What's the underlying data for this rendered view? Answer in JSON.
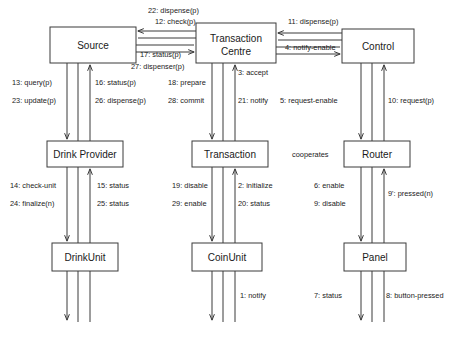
{
  "diagram": {
    "stroke_color": "#3a3a3a",
    "text_color": "#1a1a1a",
    "background": "#ffffff",
    "caption": "",
    "nodes": [
      {
        "id": "source",
        "label": "Source",
        "x": 50,
        "y": 27,
        "w": 86,
        "h": 36
      },
      {
        "id": "transaction-centre",
        "label": "Transaction",
        "label2": "Centre",
        "x": 196,
        "y": 23,
        "w": 80,
        "h": 40
      },
      {
        "id": "control",
        "label": "Control",
        "x": 342,
        "y": 29,
        "w": 72,
        "h": 34
      },
      {
        "id": "drink-provider",
        "label": "Drink Provider",
        "x": 47,
        "y": 141,
        "w": 76,
        "h": 26
      },
      {
        "id": "transaction",
        "label": "Transaction",
        "x": 192,
        "y": 141,
        "w": 76,
        "h": 26
      },
      {
        "id": "router",
        "label": "Router",
        "x": 344,
        "y": 141,
        "w": 66,
        "h": 26
      },
      {
        "id": "drinkunit",
        "label": "DrinkUnit",
        "x": 52,
        "y": 243,
        "w": 66,
        "h": 28
      },
      {
        "id": "coinunit",
        "label": "CoinUnit",
        "x": 192,
        "y": 243,
        "w": 70,
        "h": 28
      },
      {
        "id": "panel",
        "label": "Panel",
        "x": 344,
        "y": 243,
        "w": 62,
        "h": 28
      }
    ],
    "edge_labels": [
      {
        "id": "lbl-22",
        "text": "22: dispense(p)",
        "x": 148,
        "y": 13,
        "anchor": "start"
      },
      {
        "id": "lbl-12",
        "text": "12: check(p)",
        "x": 155,
        "y": 24,
        "anchor": "start"
      },
      {
        "id": "lbl-17",
        "text": "17: status(p)",
        "x": 140,
        "y": 57,
        "anchor": "start"
      },
      {
        "id": "lbl-27",
        "text": "27: dispenser(p)",
        "x": 131,
        "y": 69,
        "anchor": "start"
      },
      {
        "id": "lbl-11",
        "text": "11: dispense(p)",
        "x": 288,
        "y": 24,
        "anchor": "start"
      },
      {
        "id": "lbl-4",
        "text": "4: notify-enable",
        "x": 285,
        "y": 50,
        "anchor": "start"
      },
      {
        "id": "lbl-13",
        "text": "13: query(p)",
        "x": 12,
        "y": 85,
        "anchor": "start"
      },
      {
        "id": "lbl-23",
        "text": "23: update(p)",
        "x": 12,
        "y": 103,
        "anchor": "start"
      },
      {
        "id": "lbl-16",
        "text": "16: status(p)",
        "x": 95,
        "y": 85,
        "anchor": "start"
      },
      {
        "id": "lbl-26",
        "text": "26: dispense(p)",
        "x": 95,
        "y": 103,
        "anchor": "start"
      },
      {
        "id": "lbl-18",
        "text": "18: prepare",
        "x": 168,
        "y": 85,
        "anchor": "start"
      },
      {
        "id": "lbl-28",
        "text": "28: commit",
        "x": 168,
        "y": 103,
        "anchor": "start"
      },
      {
        "id": "lbl-3",
        "text": "3: accept",
        "x": 238,
        "y": 75,
        "anchor": "start"
      },
      {
        "id": "lbl-21",
        "text": "21: notify",
        "x": 238,
        "y": 103,
        "anchor": "start"
      },
      {
        "id": "lbl-5",
        "text": "5: request-enable",
        "x": 280,
        "y": 103,
        "anchor": "start"
      },
      {
        "id": "lbl-10",
        "text": "10: request(p)",
        "x": 388,
        "y": 103,
        "anchor": "start"
      },
      {
        "id": "lbl-14",
        "text": "14: check-unit",
        "x": 10,
        "y": 188,
        "anchor": "start"
      },
      {
        "id": "lbl-24",
        "text": "24: finalize(n)",
        "x": 10,
        "y": 206,
        "anchor": "start"
      },
      {
        "id": "lbl-15",
        "text": "15: status",
        "x": 97,
        "y": 188,
        "anchor": "start"
      },
      {
        "id": "lbl-25",
        "text": "25: status",
        "x": 97,
        "y": 206,
        "anchor": "start"
      },
      {
        "id": "lbl-19",
        "text": "19: disable",
        "x": 172,
        "y": 188,
        "anchor": "start"
      },
      {
        "id": "lbl-29",
        "text": "29: enable",
        "x": 172,
        "y": 206,
        "anchor": "start"
      },
      {
        "id": "lbl-2",
        "text": "2: initialize",
        "x": 238,
        "y": 188,
        "anchor": "start"
      },
      {
        "id": "lbl-20",
        "text": "20: status",
        "x": 238,
        "y": 206,
        "anchor": "start"
      },
      {
        "id": "lbl-coop",
        "text": "cooperates",
        "x": 292,
        "y": 157,
        "anchor": "start"
      },
      {
        "id": "lbl-6",
        "text": "6: enable",
        "x": 314,
        "y": 188,
        "anchor": "start"
      },
      {
        "id": "lbl-9",
        "text": "9: disable",
        "x": 314,
        "y": 206,
        "anchor": "start"
      },
      {
        "id": "lbl-9p",
        "text": "9': pressed(n)",
        "x": 388,
        "y": 196,
        "anchor": "start"
      },
      {
        "id": "lbl-1",
        "text": "1: notify",
        "x": 240,
        "y": 298,
        "anchor": "start"
      },
      {
        "id": "lbl-7",
        "text": "7: status",
        "x": 314,
        "y": 298,
        "anchor": "start"
      },
      {
        "id": "lbl-8",
        "text": "8: button-pressed",
        "x": 386,
        "y": 298,
        "anchor": "start"
      }
    ]
  }
}
